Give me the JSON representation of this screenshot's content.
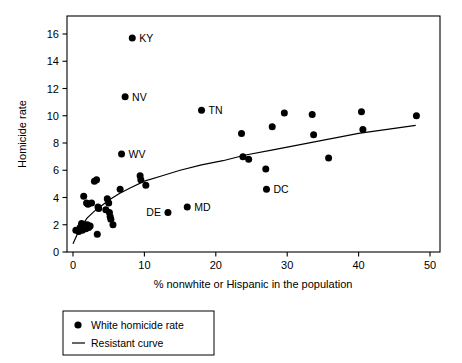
{
  "chart_data": {
    "type": "scatter",
    "title": "",
    "xlabel": "% nonwhite or Hispanic in the population",
    "ylabel": "Homicide rate",
    "xlim": [
      0,
      50
    ],
    "ylim": [
      0,
      16
    ],
    "xticks": [
      0,
      10,
      20,
      30,
      40,
      50
    ],
    "yticks": [
      0,
      2,
      4,
      6,
      8,
      10,
      12,
      14,
      16
    ],
    "grid": false,
    "legend_position": "below-left",
    "legend": [
      {
        "marker": "dot",
        "label": "White homicide rate"
      },
      {
        "marker": "line",
        "label": "Resistant curve"
      }
    ],
    "series": [
      {
        "name": "White homicide rate",
        "marker": "filled-circle",
        "color": "#000000",
        "points": [
          {
            "x": 0.4,
            "y": 1.6
          },
          {
            "x": 0.8,
            "y": 1.5
          },
          {
            "x": 1.0,
            "y": 1.8
          },
          {
            "x": 1.2,
            "y": 2.1
          },
          {
            "x": 1.3,
            "y": 1.6
          },
          {
            "x": 1.5,
            "y": 4.1
          },
          {
            "x": 1.6,
            "y": 2.0
          },
          {
            "x": 1.8,
            "y": 1.7
          },
          {
            "x": 1.9,
            "y": 3.6
          },
          {
            "x": 2.0,
            "y": 2.0
          },
          {
            "x": 2.1,
            "y": 3.5
          },
          {
            "x": 2.2,
            "y": 1.8
          },
          {
            "x": 2.4,
            "y": 1.9
          },
          {
            "x": 2.6,
            "y": 3.6
          },
          {
            "x": 3.0,
            "y": 5.2
          },
          {
            "x": 3.3,
            "y": 5.3
          },
          {
            "x": 3.4,
            "y": 1.3
          },
          {
            "x": 3.5,
            "y": 3.3
          },
          {
            "x": 3.6,
            "y": 3.2
          },
          {
            "x": 4.6,
            "y": 3.1
          },
          {
            "x": 4.8,
            "y": 3.9
          },
          {
            "x": 5.0,
            "y": 3.6
          },
          {
            "x": 5.1,
            "y": 2.9
          },
          {
            "x": 5.2,
            "y": 2.6
          },
          {
            "x": 5.3,
            "y": 2.4
          },
          {
            "x": 5.6,
            "y": 2.0
          },
          {
            "x": 6.6,
            "y": 4.6
          },
          {
            "x": 9.4,
            "y": 5.6
          },
          {
            "x": 9.5,
            "y": 5.3
          },
          {
            "x": 10.2,
            "y": 4.9
          },
          {
            "x": 23.6,
            "y": 8.7
          },
          {
            "x": 23.8,
            "y": 7.0
          },
          {
            "x": 24.6,
            "y": 6.8
          },
          {
            "x": 27.0,
            "y": 6.1
          },
          {
            "x": 27.9,
            "y": 9.2
          },
          {
            "x": 29.6,
            "y": 10.2
          },
          {
            "x": 33.5,
            "y": 10.1
          },
          {
            "x": 33.7,
            "y": 8.6
          },
          {
            "x": 35.8,
            "y": 6.9
          },
          {
            "x": 40.4,
            "y": 10.3
          },
          {
            "x": 40.6,
            "y": 9.0
          },
          {
            "x": 48.1,
            "y": 10.0
          }
        ]
      }
    ],
    "labeled_points": [
      {
        "label": "KY",
        "x": 8.3,
        "y": 15.7,
        "label_side": "right"
      },
      {
        "label": "NV",
        "x": 7.3,
        "y": 11.4,
        "label_side": "right"
      },
      {
        "label": "TN",
        "x": 18.0,
        "y": 10.4,
        "label_side": "right"
      },
      {
        "label": "WV",
        "x": 6.8,
        "y": 7.2,
        "label_side": "right"
      },
      {
        "label": "DC",
        "x": 27.1,
        "y": 4.6,
        "label_side": "right"
      },
      {
        "label": "MD",
        "x": 16.0,
        "y": 3.3,
        "label_side": "right"
      },
      {
        "label": "DE",
        "x": 13.3,
        "y": 2.9,
        "label_side": "left"
      }
    ],
    "resistant_curve": {
      "name": "Resistant curve",
      "color": "#000000",
      "points": [
        {
          "x": 0.0,
          "y": 0.6
        },
        {
          "x": 0.6,
          "y": 1.3
        },
        {
          "x": 1.2,
          "y": 1.9
        },
        {
          "x": 2.0,
          "y": 2.5
        },
        {
          "x": 3.0,
          "y": 3.0
        },
        {
          "x": 4.0,
          "y": 3.4
        },
        {
          "x": 5.0,
          "y": 3.8
        },
        {
          "x": 6.5,
          "y": 4.3
        },
        {
          "x": 8.0,
          "y": 4.7
        },
        {
          "x": 10.0,
          "y": 5.2
        },
        {
          "x": 12.5,
          "y": 5.6
        },
        {
          "x": 15.0,
          "y": 6.0
        },
        {
          "x": 18.0,
          "y": 6.4
        },
        {
          "x": 21.0,
          "y": 6.7
        },
        {
          "x": 24.0,
          "y": 7.1
        },
        {
          "x": 28.0,
          "y": 7.5
        },
        {
          "x": 32.0,
          "y": 7.9
        },
        {
          "x": 36.0,
          "y": 8.3
        },
        {
          "x": 40.0,
          "y": 8.7
        },
        {
          "x": 44.0,
          "y": 9.0
        },
        {
          "x": 48.0,
          "y": 9.3
        }
      ]
    }
  },
  "axis": {
    "x_tick_labels": [
      "0",
      "10",
      "20",
      "30",
      "40",
      "50"
    ],
    "y_tick_labels": [
      "0",
      "2",
      "4",
      "6",
      "8",
      "10",
      "12",
      "14",
      "16"
    ],
    "x_title": "% nonwhite or Hispanic in the population",
    "y_title": "Homicide rate"
  },
  "legend": {
    "item_dot_label": "White homicide rate",
    "item_line_label": "Resistant curve"
  },
  "labels": {
    "KY": "KY",
    "NV": "NV",
    "TN": "TN",
    "WV": "WV",
    "DC": "DC",
    "MD": "MD",
    "DE": "DE"
  },
  "colors": {
    "marker": "#000000",
    "curve": "#000000",
    "axis": "#000000",
    "background": "#ffffff"
  }
}
